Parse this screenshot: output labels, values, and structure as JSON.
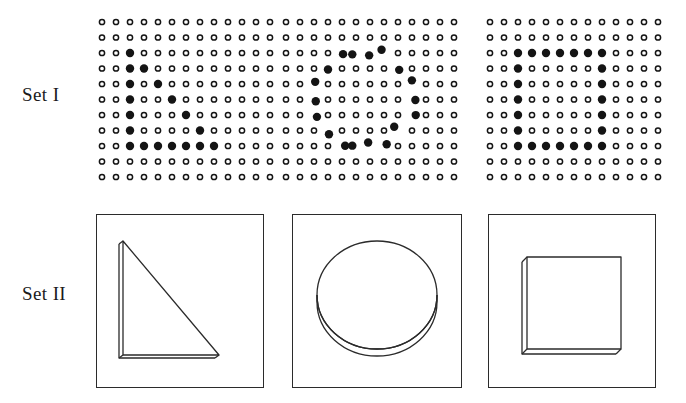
{
  "figure": {
    "background": "#ffffff",
    "ink": "#1a1a1a",
    "width": 686,
    "height": 403
  },
  "rows": [
    {
      "id": "set-1",
      "label": "Set I"
    },
    {
      "id": "set-2",
      "label": "Set II"
    }
  ],
  "set_1": {
    "label": "Set I",
    "description": "Dot-matrix arrays; a subset of enlarged filled dots traces a shape outline",
    "grid": {
      "columns": 13,
      "rows": 11,
      "spacing_x": 14,
      "spacing_y": 15.5,
      "open_dot_radius": 2.6,
      "open_dot_stroke": 1.5,
      "filled_dot_radius": 4.2,
      "dot_color": "#141414"
    },
    "patterns": [
      {
        "name": "dot-triangle",
        "shape": "triangle",
        "filled": [
          [
            2,
            2
          ],
          [
            2,
            3
          ],
          [
            3,
            3
          ],
          [
            2,
            4
          ],
          [
            4,
            4
          ],
          [
            2,
            5
          ],
          [
            5,
            5
          ],
          [
            2,
            6
          ],
          [
            6,
            6
          ],
          [
            2,
            7
          ],
          [
            7,
            7
          ],
          [
            2,
            8
          ],
          [
            3,
            8
          ],
          [
            4,
            8
          ],
          [
            5,
            8
          ],
          [
            6,
            8
          ],
          [
            7,
            8
          ],
          [
            8,
            8
          ]
        ],
        "jitter": 0
      },
      {
        "name": "dot-circle",
        "shape": "circle",
        "filled": [
          [
            4,
            2
          ],
          [
            5,
            2
          ],
          [
            6,
            2
          ],
          [
            7,
            2
          ],
          [
            3,
            3
          ],
          [
            8,
            3
          ],
          [
            2,
            4
          ],
          [
            9,
            4
          ],
          [
            2,
            5
          ],
          [
            9,
            5
          ],
          [
            2,
            6
          ],
          [
            9,
            6
          ],
          [
            3,
            7
          ],
          [
            8,
            7
          ],
          [
            4,
            8
          ],
          [
            5,
            8
          ],
          [
            6,
            8
          ],
          [
            7,
            8
          ]
        ],
        "jitter": 4
      },
      {
        "name": "dot-square",
        "shape": "square",
        "filled": [
          [
            2,
            2
          ],
          [
            3,
            2
          ],
          [
            4,
            2
          ],
          [
            5,
            2
          ],
          [
            6,
            2
          ],
          [
            7,
            2
          ],
          [
            8,
            2
          ],
          [
            2,
            3
          ],
          [
            8,
            3
          ],
          [
            2,
            4
          ],
          [
            8,
            4
          ],
          [
            2,
            5
          ],
          [
            8,
            5
          ],
          [
            2,
            6
          ],
          [
            8,
            6
          ],
          [
            2,
            7
          ],
          [
            8,
            7
          ],
          [
            2,
            8
          ],
          [
            3,
            8
          ],
          [
            4,
            8
          ],
          [
            5,
            8
          ],
          [
            6,
            8
          ],
          [
            7,
            8
          ],
          [
            8,
            8
          ]
        ],
        "jitter": 0
      }
    ]
  },
  "set_2": {
    "label": "Set II",
    "description": "Framed line drawings of three solid objects seen in perspective",
    "frame": {
      "stroke": "#2b2b2b",
      "stroke_width": 1.3,
      "fill": "#ffffff"
    },
    "panels": [
      {
        "name": "triangle-wedge",
        "shape": "right triangle",
        "caption": ""
      },
      {
        "name": "circle-disc",
        "shape": "circle / disc",
        "caption": ""
      },
      {
        "name": "square-block",
        "shape": "square / block",
        "caption": ""
      }
    ]
  }
}
